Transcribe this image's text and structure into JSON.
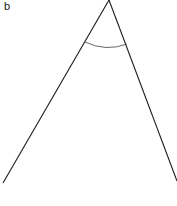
{
  "figure": {
    "panel_label": "b",
    "colors": {
      "line": "#1a1a1a",
      "arc": "#555555",
      "background": "#ffffff"
    },
    "geometry": {
      "apex": [
        109,
        0
      ],
      "left_end": [
        3,
        183
      ],
      "right_end": [
        177,
        181
      ],
      "arc_start": [
        85,
        42
      ],
      "arc_control": [
        106,
        52
      ],
      "arc_end": [
        127,
        44
      ]
    }
  }
}
